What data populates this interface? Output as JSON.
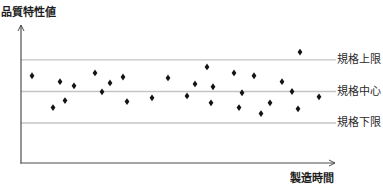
{
  "chart_data": {
    "type": "scatter",
    "title": "",
    "xlabel": "製造時間",
    "ylabel": "品質特性値",
    "grid": false,
    "legend": null,
    "marker": "diamond",
    "xlim": [
      0,
      314
    ],
    "ylim": [
      -2.27,
      2.11
    ],
    "reference_lines": [
      {
        "label": "規格上限",
        "value": 1
      },
      {
        "label": "規格中心",
        "value": 0
      },
      {
        "label": "規格下限",
        "value": -1
      }
    ],
    "x": [
      11,
      32,
      39,
      44,
      53,
      74,
      81,
      89,
      102,
      106,
      131,
      147,
      166,
      174,
      186,
      190,
      192,
      213,
      218,
      221,
      233,
      240,
      249,
      261,
      271,
      277,
      279,
      298
    ],
    "y": [
      0.5,
      -0.51,
      0.31,
      -0.29,
      0.18,
      0.59,
      -0.01,
      0.27,
      0.46,
      -0.32,
      -0.2,
      0.43,
      -0.14,
      0.24,
      0.78,
      -0.36,
      0.15,
      0.59,
      -0.51,
      -0.04,
      0.5,
      -0.7,
      -0.36,
      0.31,
      0.0,
      -0.55,
      1.25,
      -0.17
    ],
    "annotations": [
      "One point above 規格上限 (out of specification)"
    ]
  },
  "colors": {
    "axis": "#4d4d4d",
    "reference_line": "#c4c4c4",
    "marker": "#141414",
    "text": "#2a2a2a"
  }
}
